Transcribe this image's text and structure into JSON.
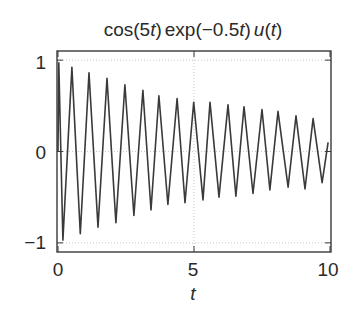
{
  "chart_data": {
    "type": "line",
    "title_parts": [
      "cos",
      "(5",
      "t",
      ")",
      "exp",
      "(",
      "−",
      "0.5",
      "t",
      ")",
      "u",
      "(",
      "t",
      ")"
    ],
    "xlabel": "t",
    "ylabel": "",
    "xlim": [
      0,
      10
    ],
    "ylim": [
      -1.1,
      1.1
    ],
    "xticks": [
      0,
      5,
      10
    ],
    "xtick_labels": [
      "0",
      "5",
      "10"
    ],
    "yticks": [
      -1,
      0,
      1
    ],
    "ytick_labels": [
      "−1",
      "0",
      "1"
    ],
    "grid": true,
    "legend": null,
    "series": [
      {
        "name": "cos(5t) exp(−0.5t) u(t)",
        "color": "#3a3a3a",
        "x": [
          0.0,
          0.03,
          0.18,
          0.51,
          0.82,
          1.14,
          1.47,
          1.8,
          2.13,
          2.46,
          2.79,
          3.12,
          3.42,
          3.71,
          4.04,
          4.38,
          4.67,
          4.99,
          5.33,
          5.59,
          5.92,
          6.25,
          6.54,
          6.84,
          7.17,
          7.5,
          7.79,
          8.09,
          8.46,
          8.75,
          9.08,
          9.38,
          9.71,
          9.93
        ],
        "y": [
          0.0,
          0.97,
          -0.97,
          0.92,
          -0.9,
          0.86,
          -0.83,
          0.8,
          -0.78,
          0.73,
          -0.7,
          0.67,
          -0.64,
          0.61,
          -0.58,
          0.58,
          -0.56,
          0.54,
          -0.53,
          0.54,
          -0.5,
          0.51,
          -0.49,
          0.49,
          -0.46,
          0.46,
          -0.42,
          0.44,
          -0.39,
          0.39,
          -0.41,
          0.36,
          -0.34,
          0.1
        ]
      }
    ]
  },
  "colors": {
    "line": "#3a3a3a",
    "axes": "#3a3a3a",
    "grid": "#c8c8c8",
    "background": "#ffffff"
  },
  "layout": {
    "plot_left": 57,
    "plot_top": 51,
    "plot_right": 331,
    "plot_bottom": 252
  }
}
